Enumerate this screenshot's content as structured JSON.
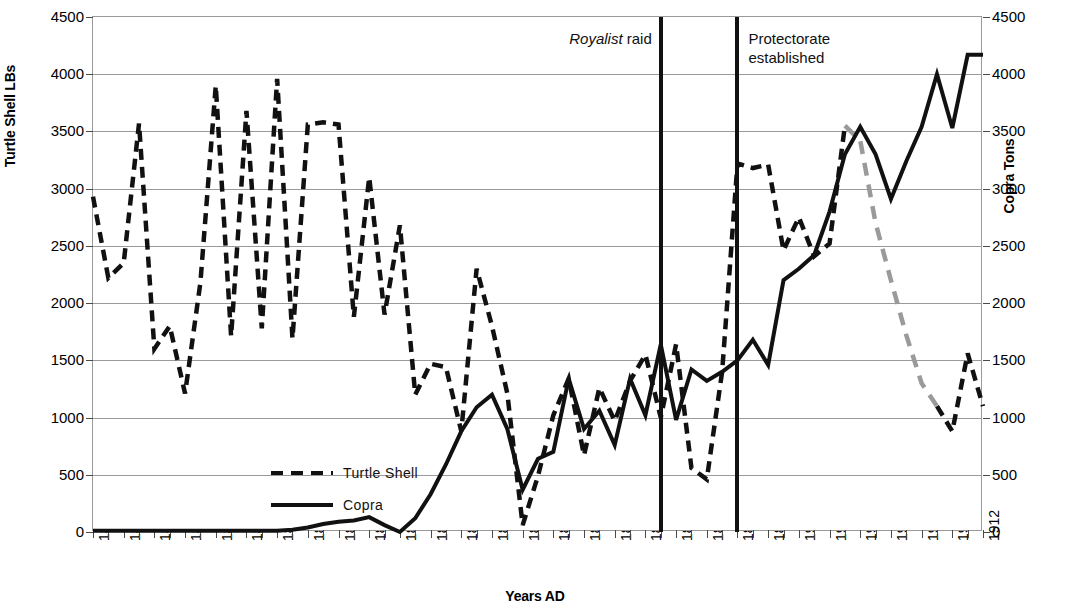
{
  "chart_data": {
    "type": "line",
    "title": "",
    "xlabel": "Years AD",
    "ylabel": "Turtle Shell LBs",
    "y2label": "Copra Tons",
    "xlim": [
      1854,
      1912
    ],
    "ylim": [
      0,
      4500
    ],
    "y2lim": [
      0,
      4500
    ],
    "grid": true,
    "legend_position": "inside-lower-left",
    "y_ticks": [
      0,
      500,
      1000,
      1500,
      2000,
      2500,
      3000,
      3500,
      4000,
      4500
    ],
    "y_tick_labels": [
      "0",
      "500",
      "1000",
      "1500",
      "2000",
      "2500",
      "3000",
      "3500",
      "4000",
      "4500"
    ],
    "y2_ticks": [
      0,
      500,
      1000,
      1500,
      2000,
      2500,
      3000,
      3500,
      4000,
      4500
    ],
    "y2_tick_labels": [
      "0",
      "500",
      "1000",
      "1500",
      "2000",
      "2500",
      "3000",
      "3500",
      "4000",
      "4500"
    ],
    "x_tick_labels": [
      "1854",
      "1856",
      "1858",
      "1860",
      "1862",
      "1864",
      "1866",
      "1868",
      "1870",
      "1872",
      "1874",
      "1876",
      "1878",
      "1880",
      "1882",
      "1884",
      "1886",
      "1888",
      "1890",
      "1892",
      "1894",
      "1896",
      "1898",
      "1900",
      "1902",
      "1904",
      "1906",
      "1908",
      "1910",
      "1912"
    ],
    "x": [
      1854,
      1855,
      1856,
      1857,
      1858,
      1859,
      1860,
      1861,
      1862,
      1863,
      1864,
      1865,
      1866,
      1867,
      1868,
      1869,
      1870,
      1871,
      1872,
      1873,
      1874,
      1875,
      1876,
      1877,
      1878,
      1879,
      1880,
      1881,
      1882,
      1883,
      1884,
      1885,
      1886,
      1887,
      1888,
      1889,
      1890,
      1891,
      1892,
      1893,
      1894,
      1895,
      1896,
      1897,
      1898,
      1899,
      1900,
      1901,
      1902,
      1903,
      1904,
      1905,
      1906,
      1907,
      1908,
      1909,
      1910,
      1911,
      1912
    ],
    "series": [
      {
        "name": "Turtle Shell",
        "style": "dashed",
        "color": "#111111",
        "axis": "left",
        "unit": "LBs",
        "values": [
          2930,
          2220,
          2350,
          3570,
          1600,
          1800,
          1210,
          2180,
          3900,
          1710,
          3680,
          1780,
          3960,
          1690,
          3560,
          3580,
          3560,
          1880,
          3100,
          1900,
          2680,
          1200,
          1470,
          1440,
          880,
          2300,
          1800,
          1210,
          60,
          490,
          1020,
          1340,
          670,
          1260,
          970,
          1320,
          1550,
          1000,
          1640,
          560,
          460,
          1400,
          3220,
          3180,
          3210,
          2460,
          2750,
          2410,
          2520,
          3550,
          null,
          null,
          null,
          null,
          null,
          1100,
          880,
          1560,
          1100
        ]
      },
      {
        "name": "Turtle Shell (projected)",
        "style": "dashed",
        "color": "#9a9a9a",
        "axis": "left",
        "unit": "LBs",
        "values": [
          null,
          null,
          null,
          null,
          null,
          null,
          null,
          null,
          null,
          null,
          null,
          null,
          null,
          null,
          null,
          null,
          null,
          null,
          null,
          null,
          null,
          null,
          null,
          null,
          null,
          null,
          null,
          null,
          null,
          null,
          null,
          null,
          null,
          null,
          null,
          null,
          null,
          null,
          null,
          null,
          null,
          null,
          null,
          null,
          null,
          null,
          null,
          null,
          null,
          3550,
          3420,
          2700,
          2200,
          1720,
          1300,
          1100,
          null,
          null,
          null
        ]
      },
      {
        "name": "Copra",
        "style": "solid",
        "color": "#111111",
        "axis": "right",
        "unit": "Tons",
        "values": [
          10,
          10,
          10,
          10,
          10,
          10,
          10,
          10,
          10,
          10,
          10,
          10,
          10,
          20,
          40,
          70,
          90,
          100,
          130,
          60,
          0,
          120,
          330,
          590,
          880,
          1090,
          1200,
          900,
          370,
          640,
          700,
          1340,
          900,
          1060,
          760,
          1340,
          1020,
          1640,
          980,
          1420,
          1320,
          1400,
          1500,
          1680,
          1460,
          2200,
          2300,
          2420,
          2800,
          3300,
          3540,
          3300,
          2910,
          3240,
          3540,
          4000,
          3530,
          4170,
          4170
        ]
      }
    ],
    "annotations": [
      {
        "id": "royalist-raid",
        "text_italic": "Royalist",
        "text_rest": " raid",
        "x": 1891
      },
      {
        "id": "protectorate-established",
        "text": "Protectorate\nestablished",
        "x": 1896
      }
    ]
  },
  "legend": {
    "items": [
      {
        "label": "Turtle Shell",
        "style": "dashed"
      },
      {
        "label": "Copra",
        "style": "solid"
      }
    ]
  },
  "axes": {
    "left_title": "Turtle Shell LBs",
    "right_title": "Copra Tons",
    "x_title": "Years AD"
  },
  "colors": {
    "series": "#111111",
    "projected": "#9a9a9a",
    "grid": "#9a9a9a",
    "background": "#ffffff"
  }
}
